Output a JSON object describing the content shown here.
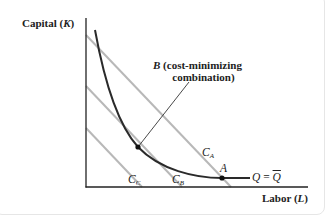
{
  "diagram": {
    "type": "isocost-isoquant",
    "y_axis": {
      "label": "Capital",
      "var": "K"
    },
    "x_axis": {
      "label": "Labor",
      "var": "L"
    },
    "isoquant": {
      "label_lhs": "Q",
      "eq": "=",
      "label_rhs": "Q"
    },
    "isocost_lines": [
      {
        "name": "C",
        "sub": "A"
      },
      {
        "name": "C",
        "sub": "B"
      },
      {
        "name": "C",
        "sub": "C"
      }
    ],
    "points": {
      "A": {
        "label": "A"
      },
      "B": {
        "label": "B",
        "note_line1": "(cost-minimizing",
        "note_line2": "combination)"
      }
    },
    "colors": {
      "axis": "#222222",
      "isoquant": "#2a2a2a",
      "isocost": "#b5b5b5",
      "text": "#222222"
    }
  }
}
